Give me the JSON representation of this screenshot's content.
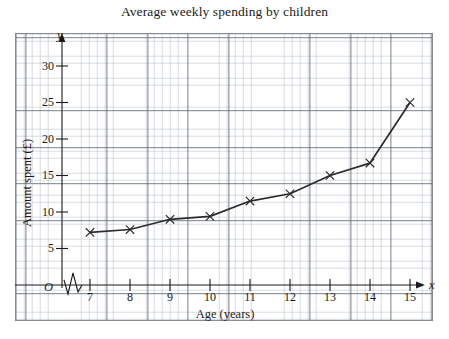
{
  "chart_data": {
    "type": "line",
    "title": "Average weekly spending by children",
    "xlabel": "Age (years)",
    "ylabel": "Amount spent (£)",
    "x_axis_letter": "x",
    "y_axis_letter": "y",
    "origin_label": "O",
    "x": [
      7,
      8,
      9,
      10,
      11,
      12,
      13,
      14,
      15
    ],
    "values": [
      7.2,
      7.6,
      9.0,
      9.4,
      11.5,
      12.5,
      15.0,
      16.7,
      25.0
    ],
    "xticks": [
      "7",
      "8",
      "9",
      "10",
      "11",
      "12",
      "13",
      "14",
      "15"
    ],
    "yticks": [
      "5",
      "10",
      "15",
      "20",
      "25",
      "30"
    ],
    "ytick_values": [
      5,
      10,
      15,
      20,
      25,
      30
    ],
    "xlim": [
      6.3,
      16.3
    ],
    "ylim": [
      0,
      32
    ],
    "grid": true,
    "grid_style": "graph-paper",
    "marker": "cross",
    "axis_break": "zigzag-on-x-axis",
    "legend": "none",
    "line_color": "#2b2b2b",
    "grid_major_color": "#555c69",
    "grid_minor_color": "#8c96a5",
    "axis_color": "#1a1a1a"
  }
}
